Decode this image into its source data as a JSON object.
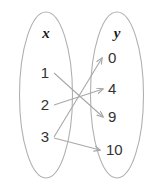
{
  "diagram": {
    "type": "mapping-diagram",
    "domain": {
      "header": "x",
      "elements": [
        {
          "value": "1"
        },
        {
          "value": "2"
        },
        {
          "value": "3"
        }
      ]
    },
    "range": {
      "header": "y",
      "elements": [
        {
          "value": "0"
        },
        {
          "value": "4"
        },
        {
          "value": "9"
        },
        {
          "value": "10"
        }
      ]
    },
    "mappings": [
      {
        "from": "1",
        "to": "9"
      },
      {
        "from": "2",
        "to": "4"
      },
      {
        "from": "3",
        "to": "0"
      },
      {
        "from": "3",
        "to": "10"
      }
    ],
    "colors": {
      "ellipse_stroke": "#b0b0b0",
      "arrow_stroke": "#a8a8a8",
      "header_text": "#1a1a1a",
      "element_text": "#333333",
      "background": "#ffffff"
    }
  }
}
